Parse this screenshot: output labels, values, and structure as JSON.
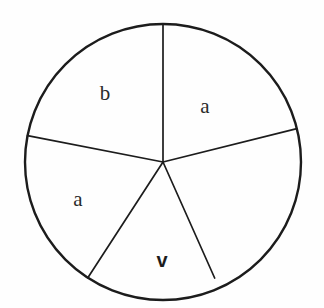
{
  "figure": {
    "kind": "sector-circle-diagram",
    "background_color": "#fefefe",
    "stroke_color": "#1c1c1c",
    "circle": {
      "center_x": 163,
      "center_y": 162,
      "radius": 138,
      "stroke_width": 2.4
    },
    "radii": [
      {
        "name": "radius-up",
        "angle_deg": 90,
        "length": 138,
        "stroke_width": 1.7,
        "touches_rim": true
      },
      {
        "name": "radius-upper-left",
        "angle_deg": 169,
        "length": 138,
        "stroke_width": 1.7,
        "touches_rim": true
      },
      {
        "name": "radius-lower-left",
        "angle_deg": 237,
        "length": 138,
        "stroke_width": 1.7,
        "touches_rim": true
      },
      {
        "name": "radius-lower-right",
        "angle_deg": 294,
        "length": 127,
        "stroke_width": 1.7,
        "touches_rim": false
      },
      {
        "name": "radius-right",
        "angle_deg": 14,
        "length": 138,
        "stroke_width": 1.7,
        "touches_rim": true
      }
    ],
    "labels": [
      {
        "name": "sector-label-b",
        "text": "b",
        "x": 105,
        "y": 100,
        "bold": false
      },
      {
        "name": "sector-label-a-right",
        "text": "a",
        "x": 205,
        "y": 113,
        "bold": false
      },
      {
        "name": "sector-label-a-left",
        "text": "a",
        "x": 78,
        "y": 206,
        "bold": false
      },
      {
        "name": "sector-label-v",
        "text": "v",
        "x": 162,
        "y": 267,
        "bold": true
      }
    ]
  }
}
